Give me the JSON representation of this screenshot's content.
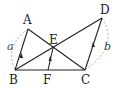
{
  "diagram": {
    "type": "geometry",
    "points": {
      "A": {
        "label": "A",
        "x": 28,
        "y": 29
      },
      "B": {
        "label": "B",
        "x": 15,
        "y": 70
      },
      "C": {
        "label": "C",
        "x": 85,
        "y": 70
      },
      "D": {
        "label": "D",
        "x": 102,
        "y": 18
      },
      "E": {
        "label": "E",
        "x": 53,
        "y": 48
      },
      "F": {
        "label": "F",
        "x": 48,
        "y": 70
      }
    },
    "segments": [
      "AB",
      "AC",
      "BD",
      "BC",
      "CD",
      "EF"
    ],
    "parallel_marks": [
      "AB",
      "EF",
      "CD"
    ],
    "lengths": {
      "AB": "a",
      "CD": "b"
    },
    "colors": {
      "line": "#222222",
      "dashed_arc": "#999999"
    }
  }
}
